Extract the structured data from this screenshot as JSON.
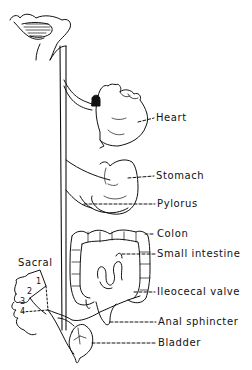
{
  "diagram": {
    "type": "anatomical-schematic",
    "labels": {
      "heart": "Heart",
      "stomach": "Stomach",
      "pylorus": "Pylorus",
      "colon": "Colon",
      "small_intestine": "Small intestine",
      "ileocecal_valve": "Ileocecal valve",
      "anal_sphincter": "Anal sphincter",
      "bladder": "Bladder",
      "sacral": "Sacral"
    },
    "sacral_segments": [
      "1",
      "2",
      "3",
      "4"
    ],
    "colors": {
      "ink": "#111111",
      "background": "#ffffff"
    }
  }
}
